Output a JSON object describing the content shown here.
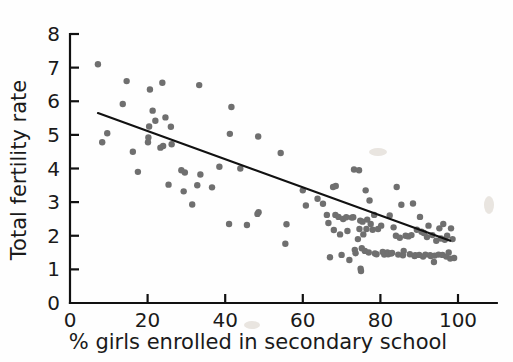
{
  "figure": {
    "background": "#ffffff",
    "dot_color": "#6f6f6f",
    "line_color": "#111111",
    "axis_color": "#111111"
  },
  "chart_data": {
    "type": "scatter",
    "title": "",
    "subtitle": "",
    "xlabel": "% girls enrolled in secondary school",
    "ylabel": "Total fertility rate",
    "xlim": [
      0,
      110
    ],
    "ylim": [
      0,
      8
    ],
    "xticks": [
      0,
      20,
      40,
      60,
      80,
      100
    ],
    "xtick_labels": [
      "0",
      "20",
      "40",
      "60",
      "80",
      "100"
    ],
    "yticks": [
      0,
      1,
      2,
      3,
      4,
      5,
      6,
      7,
      8
    ],
    "ytick_labels": [
      "0",
      "1",
      "2",
      "3",
      "4",
      "5",
      "6",
      "7",
      "8"
    ],
    "grid": false,
    "legend": null,
    "annotations": [],
    "marker": {
      "shape": "circle",
      "size_px": 4.2,
      "color": "#6f6f6f"
    },
    "series": [
      {
        "name": "Countries",
        "marker_color": "#6f6f6f",
        "points": [
          [
            7.2,
            7.1
          ],
          [
            9.6,
            5.05
          ],
          [
            8.3,
            4.78
          ],
          [
            14.6,
            6.6
          ],
          [
            13.6,
            5.92
          ],
          [
            16.2,
            4.5
          ],
          [
            17.5,
            3.9
          ],
          [
            20.6,
            6.35
          ],
          [
            21.3,
            5.72
          ],
          [
            20.4,
            5.25
          ],
          [
            20.2,
            4.92
          ],
          [
            20.1,
            4.78
          ],
          [
            22.0,
            5.42
          ],
          [
            23.8,
            6.55
          ],
          [
            24.6,
            5.52
          ],
          [
            24.0,
            4.67
          ],
          [
            23.3,
            4.62
          ],
          [
            26.0,
            5.24
          ],
          [
            26.2,
            4.72
          ],
          [
            25.4,
            3.52
          ],
          [
            28.7,
            3.95
          ],
          [
            29.6,
            3.88
          ],
          [
            29.3,
            3.32
          ],
          [
            31.5,
            2.93
          ],
          [
            32.8,
            3.5
          ],
          [
            33.3,
            6.48
          ],
          [
            33.6,
            3.82
          ],
          [
            36.6,
            3.44
          ],
          [
            38.5,
            4.05
          ],
          [
            41.6,
            5.83
          ],
          [
            41.2,
            5.03
          ],
          [
            41.0,
            2.35
          ],
          [
            43.9,
            4.0
          ],
          [
            45.6,
            2.32
          ],
          [
            48.5,
            4.95
          ],
          [
            48.6,
            2.7
          ],
          [
            48.3,
            2.65
          ],
          [
            54.3,
            4.46
          ],
          [
            55.8,
            2.34
          ],
          [
            55.5,
            1.76
          ],
          [
            60.0,
            3.35
          ],
          [
            60.8,
            2.9
          ],
          [
            63.8,
            3.1
          ],
          [
            65.2,
            2.95
          ],
          [
            66.2,
            2.62
          ],
          [
            66.6,
            2.38
          ],
          [
            67.0,
            1.36
          ],
          [
            67.8,
            3.45
          ],
          [
            68.5,
            3.48
          ],
          [
            68.4,
            2.62
          ],
          [
            68.0,
            2.17
          ],
          [
            69.2,
            2.56
          ],
          [
            69.6,
            2.04
          ],
          [
            70.4,
            2.5
          ],
          [
            70.0,
            1.43
          ],
          [
            71.2,
            2.55
          ],
          [
            71.5,
            2.14
          ],
          [
            72.0,
            1.28
          ],
          [
            72.6,
            2.54
          ],
          [
            73.2,
            3.97
          ],
          [
            73.0,
            2.55
          ],
          [
            73.4,
            1.58
          ],
          [
            73.6,
            1.48
          ],
          [
            74.5,
            3.95
          ],
          [
            74.8,
            2.45
          ],
          [
            74.6,
            2.2
          ],
          [
            74.2,
            1.9
          ],
          [
            74.9,
            1.02
          ],
          [
            75.0,
            0.95
          ],
          [
            75.4,
            2.42
          ],
          [
            75.6,
            2.04
          ],
          [
            75.2,
            1.63
          ],
          [
            76.2,
            3.35
          ],
          [
            76.6,
            2.48
          ],
          [
            76.4,
            2.2
          ],
          [
            76.0,
            1.55
          ],
          [
            77.2,
            3.05
          ],
          [
            77.5,
            2.35
          ],
          [
            77.0,
            1.5
          ],
          [
            78.4,
            2.62
          ],
          [
            78.0,
            2.18
          ],
          [
            78.6,
            1.47
          ],
          [
            79.4,
            2.2
          ],
          [
            79.0,
            1.45
          ],
          [
            80.2,
            2.3
          ],
          [
            80.6,
            1.52
          ],
          [
            81.0,
            1.44
          ],
          [
            81.8,
            1.5
          ],
          [
            82.4,
            2.6
          ],
          [
            82.0,
            1.45
          ],
          [
            82.8,
            1.47
          ],
          [
            83.4,
            2.25
          ],
          [
            83.0,
            1.49
          ],
          [
            84.2,
            3.45
          ],
          [
            84.0,
            2.0
          ],
          [
            84.6,
            1.44
          ],
          [
            85.4,
            2.92
          ],
          [
            85.0,
            1.94
          ],
          [
            85.8,
            1.42
          ],
          [
            86.5,
            2.0
          ],
          [
            86.0,
            1.55
          ],
          [
            87.2,
            1.98
          ],
          [
            87.6,
            1.45
          ],
          [
            88.4,
            2.96
          ],
          [
            88.0,
            2.02
          ],
          [
            88.8,
            1.4
          ],
          [
            89.4,
            2.18
          ],
          [
            89.0,
            1.42
          ],
          [
            90.2,
            2.56
          ],
          [
            90.6,
            2.12
          ],
          [
            90.0,
            1.43
          ],
          [
            91.2,
            2.08
          ],
          [
            91.6,
            1.44
          ],
          [
            91.0,
            1.38
          ],
          [
            92.4,
            2.3
          ],
          [
            92.0,
            1.96
          ],
          [
            92.8,
            1.42
          ],
          [
            93.4,
            2.02
          ],
          [
            93.0,
            1.4
          ],
          [
            93.8,
            1.22
          ],
          [
            94.4,
            1.85
          ],
          [
            94.0,
            1.41
          ],
          [
            95.2,
            2.22
          ],
          [
            95.6,
            1.92
          ],
          [
            95.0,
            1.44
          ],
          [
            96.2,
            2.35
          ],
          [
            96.6,
            1.88
          ],
          [
            96.0,
            1.43
          ],
          [
            97.2,
            2.0
          ],
          [
            97.6,
            1.5
          ],
          [
            97.0,
            1.38
          ],
          [
            98.2,
            2.22
          ],
          [
            98.6,
            1.9
          ],
          [
            98.0,
            1.32
          ],
          [
            99.0,
            1.34
          ]
        ]
      }
    ],
    "trendline": {
      "type": "linear-fit",
      "x_start": 7.2,
      "y_start": 5.65,
      "x_end": 98.0,
      "y_end": 1.85,
      "color": "#111111"
    }
  }
}
